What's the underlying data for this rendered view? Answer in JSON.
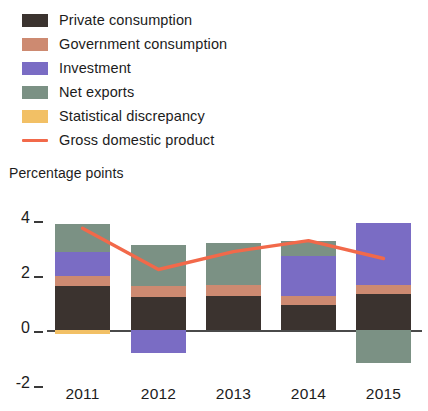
{
  "legend": {
    "items": [
      {
        "label": "Private consumption",
        "color": "#3b332f",
        "marker": "swatch",
        "icon": "legend-swatch-icon"
      },
      {
        "label": "Government consumption",
        "color": "#cd8a71",
        "marker": "swatch",
        "icon": "legend-swatch-icon"
      },
      {
        "label": "Investment",
        "color": "#7a6cc4",
        "marker": "swatch",
        "icon": "legend-swatch-icon"
      },
      {
        "label": "Net exports",
        "color": "#7b9184",
        "marker": "swatch",
        "icon": "legend-swatch-icon"
      },
      {
        "label": "Statistical discrepancy",
        "color": "#f2c065",
        "marker": "swatch",
        "icon": "legend-swatch-icon"
      },
      {
        "label": "Gross domestic product",
        "color": "#f2694a",
        "marker": "line",
        "icon": "legend-line-icon"
      }
    ]
  },
  "axis": {
    "y_title": "Percentage points",
    "y_ticks": [
      "4",
      "2",
      "0",
      "-2"
    ],
    "x_ticks": [
      "2011",
      "2012",
      "2013",
      "2014",
      "2015"
    ]
  },
  "chart_data": {
    "type": "bar",
    "title": "",
    "subtitle": "",
    "xlabel": "",
    "ylabel": "Percentage points",
    "ylim": [
      -2,
      4
    ],
    "yticks": [
      -2,
      0,
      2,
      4
    ],
    "grid": false,
    "stacked": true,
    "legend_position": "top-left",
    "categories": [
      "2011",
      "2012",
      "2013",
      "2014",
      "2015"
    ],
    "series": [
      {
        "name": "Private consumption",
        "color": "#3b332f",
        "values": [
          1.6,
          1.2,
          1.25,
          0.9,
          1.3
        ]
      },
      {
        "name": "Government consumption",
        "color": "#cd8a71",
        "values": [
          0.35,
          0.4,
          0.4,
          0.35,
          0.35
        ]
      },
      {
        "name": "Investment",
        "color": "#7a6cc4",
        "values": [
          0.9,
          -0.85,
          0.0,
          1.45,
          2.25
        ]
      },
      {
        "name": "Net exports",
        "color": "#7b9184",
        "values": [
          1.0,
          1.5,
          1.5,
          0.55,
          -1.2
        ]
      },
      {
        "name": "Statistical discrepancy",
        "color": "#f2c065",
        "values": [
          -0.15,
          0.0,
          0.0,
          0.0,
          0.0
        ]
      }
    ],
    "overlay_line": {
      "name": "Gross domestic product",
      "color": "#f2694a",
      "values": [
        3.7,
        2.2,
        2.85,
        3.25,
        2.6
      ]
    }
  }
}
